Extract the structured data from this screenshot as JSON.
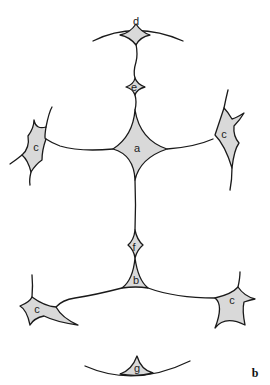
{
  "figure": {
    "panel_label": "b",
    "colors": {
      "cell_fill": "#d9d9d9",
      "outline": "#1a1a1a",
      "background": "#ffffff"
    },
    "cells": [
      {
        "id": "d",
        "label": "d",
        "x": 136,
        "y": 21
      },
      {
        "id": "e",
        "label": "e",
        "x": 134,
        "y": 87
      },
      {
        "id": "a",
        "label": "a",
        "x": 137,
        "y": 148
      },
      {
        "id": "c-upper-left",
        "label": "c",
        "x": 36,
        "y": 147
      },
      {
        "id": "c-upper-right",
        "label": "c",
        "x": 224,
        "y": 134
      },
      {
        "id": "f",
        "label": "f",
        "x": 134,
        "y": 247
      },
      {
        "id": "b",
        "label": "b",
        "x": 136,
        "y": 280
      },
      {
        "id": "c-lower-left",
        "label": "c",
        "x": 37,
        "y": 309
      },
      {
        "id": "c-lower-right",
        "label": "c",
        "x": 232,
        "y": 300
      },
      {
        "id": "g",
        "label": "g",
        "x": 137,
        "y": 368
      }
    ]
  }
}
